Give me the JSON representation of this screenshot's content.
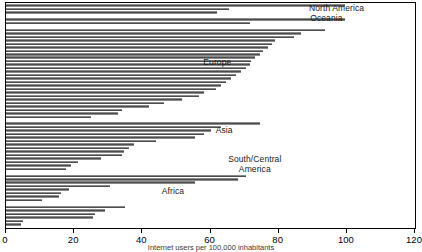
{
  "chart_data": {
    "type": "bar",
    "orientation": "horizontal",
    "title": "",
    "xlabel": "",
    "ylabel": "",
    "xlim": [
      0,
      120
    ],
    "xticks": [
      0,
      20,
      40,
      60,
      80,
      100,
      120
    ],
    "xticklabels": [
      "0",
      "20",
      "40",
      "60",
      "80",
      "100",
      "120"
    ],
    "grid": false,
    "legend": "none",
    "annotations": [
      {
        "text": "North America",
        "x": 97,
        "y_row": 1.5
      },
      {
        "text": "Oceania",
        "x": 94,
        "y_row": 4.2
      },
      {
        "text": "Europe",
        "x": 62,
        "y_row": 17.0
      },
      {
        "text": "Asia",
        "x": 64,
        "y_row": 36.5
      },
      {
        "text": "South/Central\nAmerica",
        "x": 73,
        "y_row": 46.5
      },
      {
        "text": "Africa",
        "x": 49,
        "y_row": 54.0
      }
    ],
    "groups": [
      {
        "name": "North America",
        "label": "North America",
        "values": [
          99.5,
          65.5,
          62.0
        ]
      },
      {
        "name": "Oceania",
        "label": "Oceania",
        "values": [
          99.5,
          71.5
        ]
      },
      {
        "name": "Europe",
        "label": "Europe",
        "values": [
          93.5,
          86.5,
          84.5,
          79.0,
          78.0,
          77.0,
          75.5,
          74.5,
          73.0,
          72.0,
          71.5,
          70.5,
          69.0,
          67.5,
          66.0,
          64.5,
          63.0,
          61.5,
          58.0,
          56.5,
          51.5,
          46.5,
          42.0,
          34.0,
          33.0,
          25.0
        ]
      },
      {
        "name": "Asia",
        "label": "Asia",
        "values": [
          74.5,
          63.0,
          60.0,
          58.0,
          55.5,
          44.0,
          37.5,
          36.0,
          34.5,
          34.0,
          28.0,
          21.0,
          19.0,
          17.5
        ]
      },
      {
        "name": "South/Central America",
        "label": "South/Central\nAmerica",
        "values": [
          70.5,
          68.0,
          55.5,
          30.5,
          18.5,
          16.0,
          15.5,
          10.5
        ]
      },
      {
        "name": "Africa",
        "label": "Africa",
        "values": [
          35.0,
          29.0,
          26.0,
          25.5,
          5.0,
          4.5
        ]
      }
    ]
  },
  "axis": {
    "tick_labels": [
      "0",
      "20",
      "40",
      "60",
      "80",
      "100",
      "120"
    ]
  },
  "caption": {
    "text": "Internet users per 100,000 inhabitants"
  },
  "colors": {
    "bar_fill": "#6e6e6e",
    "bar_light": "#8a8a8a",
    "bar_dark": "#4c4c4c",
    "frame": "#000000",
    "background": "#ffffff",
    "text": "#1a1a1a"
  }
}
